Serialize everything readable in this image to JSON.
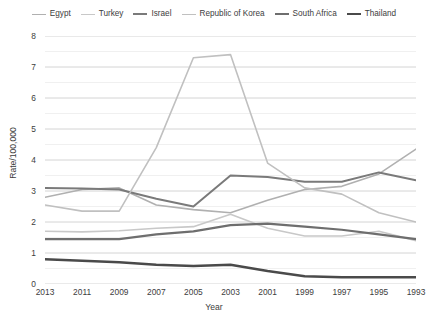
{
  "chart_data": {
    "type": "line",
    "title": "",
    "xlabel": "Year",
    "ylabel": "Rate/100,000",
    "x": [
      2013,
      2011,
      2009,
      2007,
      2005,
      2003,
      2001,
      1999,
      1997,
      1995,
      1993
    ],
    "xlim": [
      2013,
      1993
    ],
    "ylim": [
      0,
      8
    ],
    "yticks": [
      0,
      1,
      2,
      3,
      4,
      5,
      6,
      7,
      8
    ],
    "grid": true,
    "grid_axis": "y",
    "legend_position": "top",
    "x_axis_reversed": true,
    "series": [
      {
        "name": "Egypt",
        "color": "#b0b0b0",
        "width": 1.6,
        "values": [
          2.8,
          3.05,
          3.1,
          2.55,
          2.4,
          2.3,
          2.7,
          3.05,
          3.15,
          3.55,
          4.35
        ]
      },
      {
        "name": "Turkey",
        "color": "#c8c8c8",
        "width": 1.6,
        "values": [
          1.7,
          1.68,
          1.72,
          1.8,
          1.85,
          2.25,
          1.8,
          1.55,
          1.55,
          1.7,
          1.4
        ]
      },
      {
        "name": "Israel",
        "color": "#7a7a7a",
        "width": 2.0,
        "values": [
          3.1,
          3.08,
          3.05,
          2.75,
          2.5,
          3.5,
          3.45,
          3.3,
          3.3,
          3.6,
          3.35
        ]
      },
      {
        "name": "Republic of Korea",
        "color": "#c0c0c0",
        "width": 1.6,
        "values": [
          2.55,
          2.35,
          2.35,
          4.4,
          7.3,
          7.4,
          3.9,
          3.1,
          2.9,
          2.3,
          2.0
        ]
      },
      {
        "name": "South Africa",
        "color": "#6e6e6e",
        "width": 2.2,
        "values": [
          1.45,
          1.45,
          1.45,
          1.6,
          1.7,
          1.9,
          1.95,
          1.85,
          1.75,
          1.6,
          1.45
        ]
      },
      {
        "name": "Thailand",
        "color": "#4a4a4a",
        "width": 2.4,
        "values": [
          0.8,
          0.75,
          0.7,
          0.62,
          0.58,
          0.62,
          0.42,
          0.25,
          0.22,
          0.22,
          0.22
        ]
      }
    ]
  }
}
